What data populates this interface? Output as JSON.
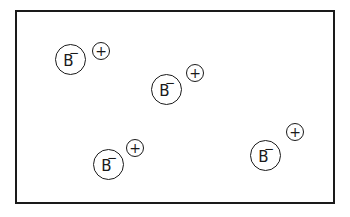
{
  "diagram": {
    "frame_color": "#1a1a1a",
    "ion_pairs": [
      {
        "anion": {
          "symbol": "B",
          "charge": "−",
          "x": 55,
          "y": 44
        },
        "cation": {
          "charge": "+",
          "x": 92,
          "y": 42
        }
      },
      {
        "anion": {
          "symbol": "B",
          "charge": "−",
          "x": 151,
          "y": 74
        },
        "cation": {
          "charge": "+",
          "x": 186,
          "y": 64
        }
      },
      {
        "anion": {
          "symbol": "B",
          "charge": "−",
          "x": 93,
          "y": 149
        },
        "cation": {
          "charge": "+",
          "x": 126,
          "y": 139
        }
      },
      {
        "anion": {
          "symbol": "B",
          "charge": "−",
          "x": 250,
          "y": 140
        },
        "cation": {
          "charge": "+",
          "x": 286,
          "y": 123
        }
      }
    ]
  }
}
